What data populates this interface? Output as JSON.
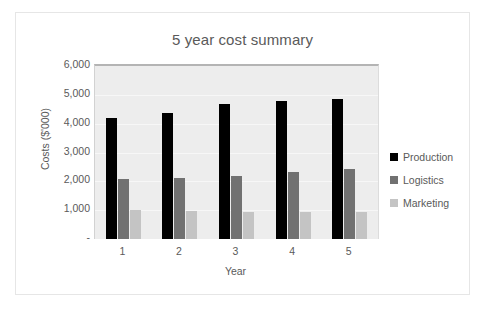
{
  "chart_data": {
    "type": "bar",
    "title": "5 year cost summary",
    "xlabel": "Year",
    "ylabel": "Costs ($'000)",
    "categories": [
      "1",
      "2",
      "3",
      "4",
      "5"
    ],
    "series": [
      {
        "name": "Production",
        "color": "#000000",
        "values": [
          4200,
          4380,
          4670,
          4790,
          4870
        ]
      },
      {
        "name": "Logistics",
        "color": "#717171",
        "values": [
          2080,
          2110,
          2180,
          2330,
          2430
        ]
      },
      {
        "name": "Marketing",
        "color": "#c4c4c4",
        "values": [
          1000,
          970,
          950,
          950,
          940
        ]
      }
    ],
    "ylim": [
      0,
      6000
    ],
    "ytick_values": [
      6000,
      5000,
      4000,
      3000,
      2000,
      1000,
      0
    ],
    "ytick_labels": [
      "6,000",
      "5,000",
      "4,000",
      "3,000",
      "2,000",
      "1,000",
      "-"
    ],
    "grid": true,
    "legend_position": "right",
    "plot_background": "#ededed"
  }
}
